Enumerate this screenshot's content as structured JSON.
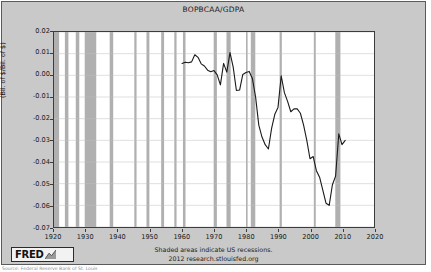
{
  "chart_data": {
    "type": "line",
    "title": "BOPBCAA/GDPA",
    "xlabel": "",
    "ylabel": "(Bil. of $/Bil. of $)",
    "xlim": [
      1920,
      2020
    ],
    "ylim": [
      -0.07,
      0.02
    ],
    "grid": true,
    "legend": null,
    "xticks": [
      1920,
      1930,
      1940,
      1950,
      1960,
      1970,
      1980,
      1990,
      2000,
      2010,
      2020
    ],
    "yticks": [
      0.02,
      0.01,
      0.0,
      -0.01,
      -0.02,
      -0.03,
      -0.04,
      -0.05,
      -0.06,
      -0.07
    ],
    "ytick_labels": [
      "0.02",
      "0.01",
      "0.00",
      "-0.01",
      "-0.02",
      "-0.03",
      "-0.04",
      "-0.05",
      "-0.06",
      "-0.07"
    ],
    "xtick_labels": [
      "1920",
      "1930",
      "1940",
      "1950",
      "1960",
      "1970",
      "1980",
      "1990",
      "2000",
      "2010",
      "2020"
    ],
    "line_color": "#1a1a1a",
    "plot_background": "#ffffff",
    "figure_background": "#c9c9c9",
    "recession_band_color": "#b0b0b0",
    "series": [
      {
        "name": "BOPBCAA/GDPA",
        "x": [
          1960,
          1961,
          1962,
          1963,
          1964,
          1965,
          1966,
          1967,
          1968,
          1969,
          1970,
          1971,
          1972,
          1973,
          1974,
          1975,
          1976,
          1977,
          1978,
          1979,
          1980,
          1981,
          1982,
          1983,
          1984,
          1985,
          1986,
          1987,
          1988,
          1989,
          1990,
          1991,
          1992,
          1993,
          1994,
          1995,
          1996,
          1997,
          1998,
          1999,
          2000,
          2001,
          2002,
          2003,
          2004,
          2005,
          2006,
          2007,
          2008,
          2009,
          2010,
          2011
        ],
        "y": [
          0.0055,
          0.006,
          0.0058,
          0.0062,
          0.0095,
          0.0083,
          0.0053,
          0.0043,
          0.0024,
          0.0017,
          0.0022,
          0.0002,
          -0.0044,
          0.0055,
          0.0015,
          0.0105,
          0.0038,
          -0.007,
          -0.0068,
          0.0004,
          0.0013,
          0.0018,
          -0.0015,
          -0.01,
          -0.023,
          -0.0285,
          -0.032,
          -0.034,
          -0.0245,
          -0.018,
          -0.0148,
          -0.0002,
          -0.008,
          -0.012,
          -0.0168,
          -0.0155,
          -0.0155,
          -0.0175,
          -0.023,
          -0.03,
          -0.0385,
          -0.0375,
          -0.044,
          -0.047,
          -0.053,
          -0.059,
          -0.06,
          -0.0505,
          -0.0465,
          -0.027,
          -0.032,
          -0.03
        ]
      }
    ],
    "recessions": [
      {
        "start": 1920.0,
        "end": 1921.6
      },
      {
        "start": 1923.4,
        "end": 1924.5
      },
      {
        "start": 1926.8,
        "end": 1927.9
      },
      {
        "start": 1929.6,
        "end": 1933.2
      },
      {
        "start": 1937.4,
        "end": 1938.5
      },
      {
        "start": 1945.1,
        "end": 1945.8
      },
      {
        "start": 1948.9,
        "end": 1949.8
      },
      {
        "start": 1953.5,
        "end": 1954.4
      },
      {
        "start": 1957.6,
        "end": 1958.3
      },
      {
        "start": 1960.3,
        "end": 1961.1
      },
      {
        "start": 1969.9,
        "end": 1970.9
      },
      {
        "start": 1973.9,
        "end": 1975.2
      },
      {
        "start": 1980.0,
        "end": 1980.5
      },
      {
        "start": 1981.5,
        "end": 1982.9
      },
      {
        "start": 1990.5,
        "end": 1991.2
      },
      {
        "start": 2001.2,
        "end": 2001.8
      },
      {
        "start": 2007.9,
        "end": 2009.5
      }
    ]
  },
  "footer": {
    "line1": "Shaded areas indicate US recessions.",
    "line2": "2012 research.stlouisfed.org"
  },
  "logo": {
    "wordmark": "FRED",
    "glyph_name": "fred-chart-glyph"
  },
  "caption": {
    "text": "Source: Federal Reserve Bank of St. Louis"
  }
}
